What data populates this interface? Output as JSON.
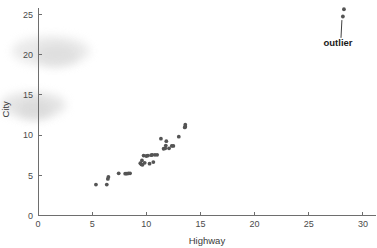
{
  "chart_data": {
    "type": "scatter",
    "title": "",
    "xlabel": "Highway",
    "ylabel": "City",
    "xlim": [
      0,
      31
    ],
    "ylim": [
      0,
      26.5
    ],
    "grid": false,
    "legend": "none",
    "x_ticks": [
      0,
      5,
      10,
      15,
      20,
      25,
      30
    ],
    "y_ticks": [
      0,
      5,
      10,
      15,
      20,
      25
    ],
    "x_tick_labels": [
      "0",
      "5",
      "10",
      "15",
      "20",
      "25",
      "30"
    ],
    "y_tick_labels": [
      "0",
      "5",
      "10",
      "15",
      "20",
      "25"
    ],
    "marker_color": "#545454",
    "marker_size": 3.0,
    "annotations": [
      {
        "text": "outlier",
        "points_to_x": 28.2,
        "points_to_y": 24.8,
        "label_x": 27.7,
        "label_y": 21.1
      }
    ],
    "points": [
      {
        "x": 5.35,
        "y": 3.85
      },
      {
        "x": 6.35,
        "y": 3.85
      },
      {
        "x": 6.45,
        "y": 4.55
      },
      {
        "x": 6.5,
        "y": 4.8
      },
      {
        "x": 7.45,
        "y": 5.25
      },
      {
        "x": 8.05,
        "y": 5.2
      },
      {
        "x": 8.2,
        "y": 5.2
      },
      {
        "x": 8.35,
        "y": 5.25
      },
      {
        "x": 8.5,
        "y": 5.25
      },
      {
        "x": 9.45,
        "y": 6.5
      },
      {
        "x": 9.55,
        "y": 6.35
      },
      {
        "x": 9.6,
        "y": 6.85
      },
      {
        "x": 9.65,
        "y": 6.3
      },
      {
        "x": 9.75,
        "y": 7.45
      },
      {
        "x": 9.85,
        "y": 6.55
      },
      {
        "x": 10.0,
        "y": 7.4
      },
      {
        "x": 10.15,
        "y": 7.45
      },
      {
        "x": 10.3,
        "y": 6.45
      },
      {
        "x": 10.45,
        "y": 7.5
      },
      {
        "x": 10.55,
        "y": 7.55
      },
      {
        "x": 10.65,
        "y": 6.65
      },
      {
        "x": 10.8,
        "y": 7.55
      },
      {
        "x": 11.0,
        "y": 7.55
      },
      {
        "x": 11.35,
        "y": 9.55
      },
      {
        "x": 11.6,
        "y": 8.3
      },
      {
        "x": 11.75,
        "y": 8.35
      },
      {
        "x": 11.8,
        "y": 8.7
      },
      {
        "x": 11.85,
        "y": 9.25
      },
      {
        "x": 12.1,
        "y": 8.35
      },
      {
        "x": 12.35,
        "y": 8.65
      },
      {
        "x": 12.5,
        "y": 8.65
      },
      {
        "x": 13.0,
        "y": 9.8
      },
      {
        "x": 13.55,
        "y": 10.95
      },
      {
        "x": 13.6,
        "y": 11.3
      },
      {
        "x": 13.6,
        "y": 11.05
      },
      {
        "x": 28.15,
        "y": 24.75
      },
      {
        "x": 28.25,
        "y": 25.65
      }
    ]
  },
  "artifacts": {
    "smudges": [
      {
        "left": 12,
        "top": 36,
        "width": 78,
        "height": 30,
        "color": "#d9d9d9",
        "opacity": 0.55
      },
      {
        "left": 36,
        "top": 44,
        "width": 42,
        "height": 22,
        "color": "#cfcfcf",
        "opacity": 0.5
      },
      {
        "left": 0,
        "top": 92,
        "width": 66,
        "height": 26,
        "color": "#d4d4d4",
        "opacity": 0.6
      },
      {
        "left": 18,
        "top": 100,
        "width": 34,
        "height": 20,
        "color": "#cccccc",
        "opacity": 0.5
      }
    ]
  }
}
